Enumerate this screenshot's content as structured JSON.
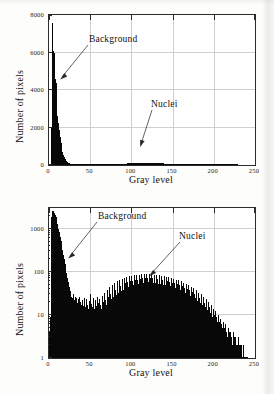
{
  "document": {
    "kind": "scanned-figure",
    "background_color": "#fdfdfb",
    "ink_color": "#080808",
    "grid_color": "#cfcfcf"
  },
  "figures": [
    {
      "id": "linear",
      "name": "gray-level-histogram-linear",
      "axis_title_x": "Gray level",
      "axis_title_y": "Number of pixels",
      "annotations": [
        {
          "label": "Background",
          "target_gray": 9,
          "target_count": 2600
        },
        {
          "label": "Nuclei",
          "target_gray": 112,
          "target_count": 190
        }
      ]
    },
    {
      "id": "log",
      "name": "gray-level-histogram-log",
      "axis_title_x": "Gray level",
      "axis_title_y": "Number of pixels",
      "annotations": [
        {
          "label": "Background",
          "target_gray": 18,
          "target_count": 330
        },
        {
          "label": "Nuclei",
          "target_gray": 128,
          "target_count": 88
        }
      ]
    }
  ],
  "chart_data": [
    {
      "type": "bar",
      "id": "linear",
      "title": "",
      "xlabel": "Gray level",
      "ylabel": "Number of pixels",
      "xlim": [
        0,
        250
      ],
      "ylim": [
        0,
        8000
      ],
      "yscale": "linear",
      "xticks": [
        0,
        50,
        100,
        150,
        200,
        250
      ],
      "xticklabels": [
        "0",
        "50",
        "100",
        "150",
        "200",
        "250"
      ],
      "yticks": [
        0,
        2000,
        4000,
        6000,
        8000
      ],
      "yticklabels": [
        "0",
        "2000",
        "4000",
        "6000",
        "8000"
      ],
      "grid": true,
      "legend": "none",
      "bin_width": 1,
      "x": [
        0,
        1,
        2,
        3,
        4,
        5,
        6,
        7,
        8,
        9,
        10,
        11,
        12,
        13,
        14,
        15,
        16,
        17,
        18,
        19,
        20,
        21,
        22,
        23,
        24,
        25,
        26,
        27,
        28,
        29,
        30,
        31,
        32,
        33,
        34,
        35,
        36,
        37,
        38,
        39,
        40,
        41,
        42,
        43,
        44,
        45,
        46,
        47,
        48,
        49,
        50,
        51,
        52,
        53,
        54,
        55,
        56,
        57,
        58,
        59,
        60,
        61,
        62,
        63,
        64,
        65,
        66,
        67,
        68,
        69,
        70,
        71,
        72,
        73,
        74,
        75,
        76,
        77,
        78,
        79,
        80,
        81,
        82,
        83,
        84,
        85,
        86,
        87,
        88,
        89,
        90,
        91,
        92,
        93,
        94,
        95,
        96,
        97,
        98,
        99,
        100,
        101,
        102,
        103,
        104,
        105,
        106,
        107,
        108,
        109,
        110,
        111,
        112,
        113,
        114,
        115,
        116,
        117,
        118,
        119,
        120,
        121,
        122,
        123,
        124,
        125,
        126,
        127,
        128,
        129,
        130,
        131,
        132,
        133,
        134,
        135,
        136,
        137,
        138,
        139,
        140,
        141,
        142,
        143,
        144,
        145,
        146,
        147,
        148,
        149,
        150,
        151,
        152,
        153,
        154,
        155,
        156,
        157,
        158,
        159,
        160,
        161,
        162,
        163,
        164,
        165,
        166,
        167,
        168,
        169,
        170,
        171,
        172,
        173,
        174,
        175,
        176,
        177,
        178,
        179,
        180,
        181,
        182,
        183,
        184,
        185,
        186,
        187,
        188,
        189,
        190,
        191,
        192,
        193,
        194,
        195,
        196,
        197,
        198,
        199,
        200,
        201,
        202,
        203,
        204,
        205,
        206,
        207,
        208,
        209,
        210,
        211,
        212,
        213,
        214,
        215,
        216,
        217,
        218,
        219,
        220,
        221,
        222,
        223,
        224,
        225,
        226,
        227,
        228,
        229,
        230,
        231,
        232,
        233,
        234,
        235,
        236,
        237,
        238,
        239,
        240,
        241,
        242,
        243,
        244,
        245,
        246,
        247,
        248,
        249,
        250
      ],
      "values": [
        6,
        14,
        430,
        2050,
        7550,
        6100,
        5980,
        4600,
        4350,
        3200,
        2600,
        2250,
        1850,
        1500,
        1180,
        900,
        690,
        540,
        430,
        320,
        250,
        190,
        150,
        120,
        96,
        80,
        66,
        54,
        46,
        40,
        36,
        32,
        30,
        28,
        26,
        25,
        24,
        24,
        23,
        23,
        22,
        22,
        21,
        21,
        20,
        20,
        20,
        19,
        19,
        19,
        18,
        18,
        18,
        17,
        17,
        17,
        17,
        16,
        16,
        16,
        16,
        16,
        16,
        16,
        17,
        17,
        18,
        19,
        21,
        24,
        28,
        32,
        36,
        40,
        44,
        47,
        50,
        53,
        55,
        58,
        60,
        62,
        64,
        66,
        68,
        70,
        71,
        72,
        74,
        75,
        76,
        77,
        78,
        79,
        80,
        81,
        82,
        83,
        84,
        85,
        86,
        86,
        87,
        88,
        88,
        89,
        89,
        90,
        90,
        90,
        90,
        90,
        90,
        89,
        89,
        89,
        88,
        88,
        88,
        87,
        87,
        87,
        87,
        88,
        88,
        89,
        89,
        90,
        90,
        90,
        89,
        89,
        88,
        87,
        86,
        85,
        84,
        83,
        82,
        80,
        78,
        76,
        74,
        72,
        70,
        68,
        66,
        64,
        61,
        59,
        57,
        55,
        52,
        50,
        47,
        45,
        42,
        40,
        37,
        35,
        32,
        30,
        28,
        26,
        24,
        22,
        20,
        18,
        17,
        15,
        14,
        12,
        11,
        10,
        9,
        8,
        7,
        7,
        6,
        6,
        5,
        5,
        5,
        4,
        4,
        4,
        4,
        3,
        3,
        3,
        3,
        3,
        3,
        3,
        3,
        3,
        3,
        3,
        3,
        3,
        3,
        2,
        2,
        2,
        2,
        2,
        2,
        2,
        2,
        2,
        2,
        2,
        2,
        2,
        2,
        2,
        2,
        2,
        2,
        2,
        1,
        1,
        1,
        1,
        1,
        1,
        1,
        1,
        1,
        0,
        0,
        0,
        0,
        0,
        0,
        0,
        0,
        0,
        0,
        0,
        0,
        0,
        0,
        0,
        0
      ]
    },
    {
      "type": "bar",
      "id": "log",
      "title": "",
      "xlabel": "Gray level",
      "ylabel": "Number of pixels",
      "xlim": [
        0,
        250
      ],
      "ylim": [
        1,
        3000
      ],
      "yscale": "log",
      "xticks": [
        0,
        50,
        100,
        150,
        200,
        250
      ],
      "xticklabels": [
        "0",
        "50",
        "100",
        "150",
        "200",
        "250"
      ],
      "yticks": [
        1,
        10,
        100,
        1000
      ],
      "yticklabels": [
        "1",
        "10",
        "100",
        "1000"
      ],
      "grid": true,
      "legend": "none",
      "bin_width": 1,
      "x": [
        0,
        1,
        2,
        3,
        4,
        5,
        6,
        7,
        8,
        9,
        10,
        11,
        12,
        13,
        14,
        15,
        16,
        17,
        18,
        19,
        20,
        21,
        22,
        23,
        24,
        25,
        26,
        27,
        28,
        29,
        30,
        31,
        32,
        33,
        34,
        35,
        36,
        37,
        38,
        39,
        40,
        41,
        42,
        43,
        44,
        45,
        46,
        47,
        48,
        49,
        50,
        51,
        52,
        53,
        54,
        55,
        56,
        57,
        58,
        59,
        60,
        61,
        62,
        63,
        64,
        65,
        66,
        67,
        68,
        69,
        70,
        71,
        72,
        73,
        74,
        75,
        76,
        77,
        78,
        79,
        80,
        81,
        82,
        83,
        84,
        85,
        86,
        87,
        88,
        89,
        90,
        91,
        92,
        93,
        94,
        95,
        96,
        97,
        98,
        99,
        100,
        101,
        102,
        103,
        104,
        105,
        106,
        107,
        108,
        109,
        110,
        111,
        112,
        113,
        114,
        115,
        116,
        117,
        118,
        119,
        120,
        121,
        122,
        123,
        124,
        125,
        126,
        127,
        128,
        129,
        130,
        131,
        132,
        133,
        134,
        135,
        136,
        137,
        138,
        139,
        140,
        141,
        142,
        143,
        144,
        145,
        146,
        147,
        148,
        149,
        150,
        151,
        152,
        153,
        154,
        155,
        156,
        157,
        158,
        159,
        160,
        161,
        162,
        163,
        164,
        165,
        166,
        167,
        168,
        169,
        170,
        171,
        172,
        173,
        174,
        175,
        176,
        177,
        178,
        179,
        180,
        181,
        182,
        183,
        184,
        185,
        186,
        187,
        188,
        189,
        190,
        191,
        192,
        193,
        194,
        195,
        196,
        197,
        198,
        199,
        200,
        201,
        202,
        203,
        204,
        205,
        206,
        207,
        208,
        209,
        210,
        211,
        212,
        213,
        214,
        215,
        216,
        217,
        218,
        219,
        220,
        221,
        222,
        223,
        224,
        225,
        226,
        227,
        228,
        229,
        230,
        231,
        232,
        233,
        234,
        235,
        236,
        237,
        238,
        239,
        240,
        241,
        242,
        243,
        244,
        245,
        246,
        247,
        248,
        249,
        250
      ],
      "values": [
        4,
        9,
        330,
        1900,
        2600,
        2500,
        2350,
        2100,
        1850,
        1500,
        1250,
        1000,
        820,
        650,
        520,
        410,
        320,
        250,
        195,
        150,
        118,
        92,
        72,
        57,
        45,
        36,
        30,
        26,
        24,
        30,
        22,
        26,
        20,
        24,
        19,
        23,
        18,
        26,
        20,
        17,
        22,
        16,
        25,
        19,
        15,
        23,
        17,
        14,
        21,
        16,
        30,
        18,
        15,
        24,
        17,
        14,
        22,
        16,
        26,
        19,
        15,
        23,
        17,
        14,
        28,
        20,
        16,
        32,
        22,
        17,
        38,
        26,
        20,
        44,
        30,
        23,
        50,
        34,
        26,
        55,
        38,
        29,
        60,
        42,
        32,
        64,
        46,
        35,
        68,
        50,
        38,
        72,
        54,
        41,
        76,
        58,
        44,
        78,
        60,
        46,
        80,
        62,
        48,
        82,
        64,
        50,
        84,
        66,
        52,
        86,
        68,
        54,
        88,
        70,
        55,
        89,
        71,
        56,
        90,
        72,
        57,
        90,
        73,
        58,
        88,
        70,
        56,
        86,
        69,
        55,
        84,
        67,
        53,
        82,
        65,
        52,
        80,
        63,
        50,
        78,
        62,
        49,
        76,
        60,
        48,
        74,
        58,
        46,
        72,
        56,
        44,
        69,
        54,
        42,
        66,
        51,
        40,
        63,
        48,
        38,
        60,
        46,
        36,
        56,
        43,
        33,
        53,
        40,
        31,
        49,
        37,
        28,
        45,
        34,
        26,
        41,
        31,
        24,
        37,
        28,
        21,
        33,
        25,
        19,
        30,
        22,
        17,
        26,
        19,
        15,
        23,
        17,
        13,
        20,
        15,
        11,
        17,
        12,
        9,
        14,
        10,
        8,
        12,
        9,
        7,
        10,
        7,
        6,
        8,
        6,
        5,
        7,
        5,
        4,
        6,
        4,
        3,
        5,
        4,
        3,
        4,
        3,
        2,
        4,
        3,
        2,
        3,
        2,
        2,
        3,
        2,
        1,
        2,
        2,
        1,
        2,
        1,
        1,
        1,
        1,
        1,
        0,
        0,
        0,
        0,
        0,
        0,
        0,
        0,
        0,
        0,
        0,
        0,
        0,
        0,
        0,
        0
      ]
    }
  ]
}
